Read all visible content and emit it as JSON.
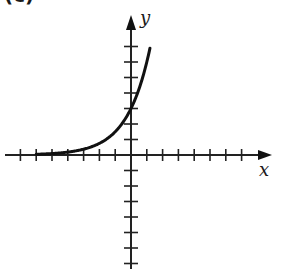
{
  "panel_label": "(c)",
  "chart_data": {
    "type": "line",
    "title": "",
    "xlabel": "x",
    "ylabel": "y",
    "xlim": [
      -8,
      9
    ],
    "ylim": [
      -7,
      8
    ],
    "x_ticks": [
      -7,
      -6,
      -5,
      -4,
      -3,
      -2,
      -1,
      1,
      2,
      3,
      4,
      5,
      6,
      7
    ],
    "y_ticks": [
      -7,
      -6,
      -5,
      -4,
      -3,
      -2,
      -1,
      1,
      2,
      3,
      4,
      5,
      6,
      7
    ],
    "tick_labels_shown": false,
    "grid": false,
    "legend": null,
    "series": [
      {
        "name": "exponential curve",
        "function": "y = 3 * 2^x",
        "x": [
          -6,
          -5,
          -4,
          -3,
          -2,
          -1,
          0,
          0.5,
          1,
          1.2
        ],
        "y": [
          0.05,
          0.09,
          0.19,
          0.38,
          0.75,
          1.5,
          3,
          4.24,
          6,
          6.9
        ],
        "y_intercept": 3,
        "asymptote": "y = 0",
        "color": "#111111"
      }
    ]
  },
  "axes": {
    "x_label": "x",
    "y_label": "y"
  }
}
